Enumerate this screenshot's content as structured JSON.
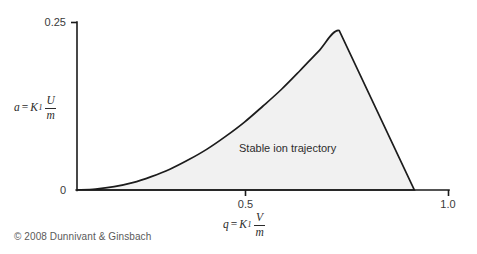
{
  "figure": {
    "copyright": "© 2008 Dunnivant & Ginsbach",
    "region_label": "Stable ion trajectory",
    "y_axis_label": {
      "variable": "a",
      "equals": "=",
      "constant": "K",
      "subscript": "1",
      "numerator": "U",
      "denominator": "m"
    },
    "x_axis_label": {
      "variable": "q",
      "equals": "=",
      "constant": "K",
      "subscript": "1",
      "numerator": "V",
      "denominator": "m"
    },
    "ticks": {
      "y_top": "0.25",
      "y_zero": "0",
      "x_mid": "0.5",
      "x_max": "1.0"
    },
    "colors": {
      "axis": "#1a1a1a",
      "curve": "#1c1c1c",
      "fill": "#f1f1f1",
      "background": "#ffffff",
      "text": "#231f20"
    }
  },
  "chart_data": {
    "type": "area",
    "title": "",
    "subtitle": "",
    "xlabel": "q = K1 V/m",
    "ylabel": "a = K1 U/m",
    "xlim": [
      0,
      1.0
    ],
    "ylim": [
      0,
      0.25
    ],
    "grid": false,
    "legend": null,
    "xticks": [
      0,
      0.5,
      1.0
    ],
    "xticklabels": [
      "0",
      "0.5",
      "1.0"
    ],
    "yticks": [
      0,
      0.25
    ],
    "yticklabels": [
      "0",
      "0.25"
    ],
    "annotations": [
      {
        "text": "Stable ion trajectory",
        "x": 0.62,
        "y": 0.055
      }
    ],
    "series": [
      {
        "name": "Mathieu stability region boundary",
        "description": "Upper boundary of the first stability region of the Mathieu equation; rises convexly from the origin to an apex then falls linearly to the q axis.",
        "apex": {
          "x": 0.706,
          "y": 0.2379
        },
        "x_intercept_right": 0.908,
        "x": [
          0.0,
          0.05,
          0.1,
          0.15,
          0.2,
          0.25,
          0.3,
          0.35,
          0.4,
          0.45,
          0.5,
          0.55,
          0.6,
          0.65,
          0.706,
          0.75,
          0.8,
          0.85,
          0.908
        ],
        "y": [
          0.0,
          0.0015,
          0.005,
          0.011,
          0.02,
          0.031,
          0.045,
          0.061,
          0.08,
          0.101,
          0.125,
          0.15,
          0.178,
          0.207,
          0.2379,
          0.188,
          0.129,
          0.07,
          0.0
        ]
      }
    ]
  }
}
